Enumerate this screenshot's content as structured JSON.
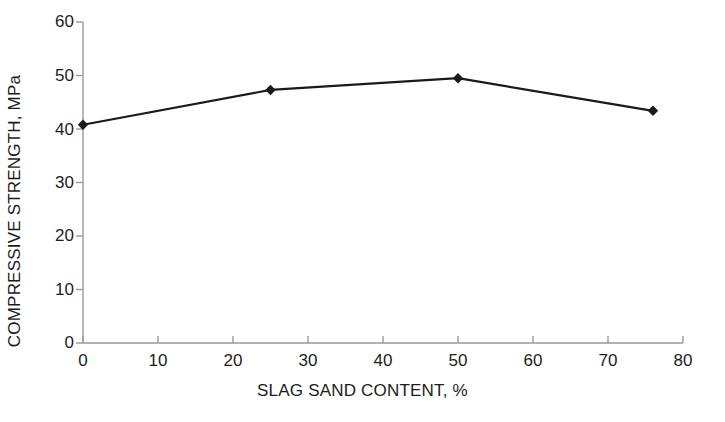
{
  "chart_data": {
    "type": "line",
    "title": "",
    "xlabel": "SLAG SAND CONTENT, %",
    "ylabel": "COMPRESSIVE STRENGTH, MPa",
    "xlim": [
      0,
      80
    ],
    "ylim": [
      0,
      60
    ],
    "xticks": [
      0,
      10,
      20,
      30,
      40,
      50,
      60,
      70,
      80
    ],
    "yticks": [
      0,
      10,
      20,
      30,
      40,
      50,
      60
    ],
    "xtick_labels": [
      "0",
      "10",
      "20",
      "30",
      "40",
      "50",
      "60",
      "70",
      "80"
    ],
    "ytick_labels": [
      "0",
      "10",
      "20",
      "30",
      "40",
      "50",
      "60"
    ],
    "grid": false,
    "legend": null,
    "series": [
      {
        "name": "Compressive strength",
        "marker": "diamond",
        "color": "#1a1a1a",
        "x": [
          0,
          25,
          50,
          76
        ],
        "values": [
          40.8,
          47.3,
          49.5,
          43.4
        ]
      }
    ],
    "annotations": []
  },
  "axes": {
    "line_color": "#9a9a9a",
    "tick_color": "#9a9a9a",
    "text_color": "#1c1c1c"
  }
}
